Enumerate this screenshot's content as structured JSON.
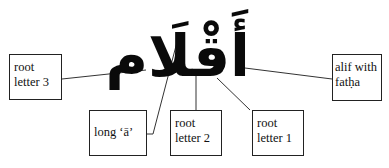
{
  "word": {
    "arabic": "أَقْلَام",
    "description": "plural word with labeled parts"
  },
  "labels": [
    {
      "id": "root-letter-3",
      "lines": [
        "root",
        "letter 3"
      ]
    },
    {
      "id": "long-a",
      "lines": [
        "long ‘ā’"
      ]
    },
    {
      "id": "root-letter-2",
      "lines": [
        "root",
        "letter 2"
      ]
    },
    {
      "id": "root-letter-1",
      "lines": [
        "root",
        "letter 1"
      ]
    },
    {
      "id": "alif-with-fatha",
      "lines": [
        "alif with",
        "fatḥa"
      ]
    }
  ],
  "colors": {
    "line": "#333333",
    "border": "#222222",
    "text": "#111111",
    "background": "#ffffff"
  }
}
